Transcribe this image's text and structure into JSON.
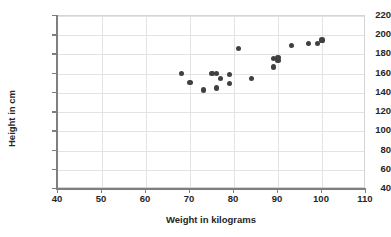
{
  "chart_data": {
    "type": "scatter",
    "title": "",
    "xlabel": "Weight in kilograms",
    "ylabel": "Height in cm",
    "xlim": [
      40,
      110
    ],
    "ylim": [
      40,
      220
    ],
    "xticks": [
      40,
      50,
      60,
      70,
      80,
      90,
      100,
      110
    ],
    "yticks": [
      40,
      60,
      80,
      100,
      120,
      140,
      160,
      180,
      200,
      220
    ],
    "grid": true,
    "legend": false,
    "marker_color": "#404040",
    "series": [
      {
        "name": "Height vs Weight",
        "points": [
          {
            "x": 68,
            "y": 160
          },
          {
            "x": 70,
            "y": 151
          },
          {
            "x": 73,
            "y": 143
          },
          {
            "x": 75,
            "y": 160
          },
          {
            "x": 76,
            "y": 160
          },
          {
            "x": 76,
            "y": 145
          },
          {
            "x": 77,
            "y": 155
          },
          {
            "x": 79,
            "y": 150
          },
          {
            "x": 79,
            "y": 159
          },
          {
            "x": 81,
            "y": 186
          },
          {
            "x": 84,
            "y": 155
          },
          {
            "x": 89,
            "y": 167
          },
          {
            "x": 89,
            "y": 176
          },
          {
            "x": 90,
            "y": 177
          },
          {
            "x": 90,
            "y": 174
          },
          {
            "x": 93,
            "y": 189
          },
          {
            "x": 97,
            "y": 191
          },
          {
            "x": 99,
            "y": 191
          },
          {
            "x": 100,
            "y": 195
          }
        ]
      }
    ]
  },
  "axes": {
    "y_title": "Height in cm",
    "x_title": "Weight in kilograms",
    "y_tick_labels": [
      "220",
      "200",
      "180",
      "160",
      "140",
      "120",
      "100",
      "80",
      "60",
      "40"
    ],
    "x_tick_labels": [
      "40",
      "50",
      "60",
      "70",
      "80",
      "90",
      "100",
      "110"
    ]
  },
  "colors": {
    "marker": "#404040",
    "gridline": "#e3e3e3",
    "axis": "#7f7f7f",
    "text": "#262626",
    "background": "#ffffff"
  }
}
